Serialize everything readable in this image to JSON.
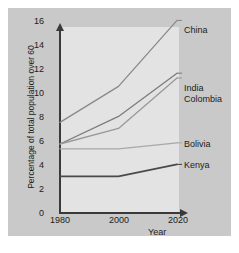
{
  "chart_data": {
    "type": "line",
    "title": "",
    "xlabel": "Year",
    "ylabel": "Percentage of total population over 60",
    "x": [
      1980,
      2000,
      2020
    ],
    "xtick_labels": [
      "1980",
      "2000",
      "2020"
    ],
    "ytick_labels": [
      "0",
      "2",
      "4",
      "6",
      "8",
      "10",
      "12",
      "14",
      "16"
    ],
    "yticks": [
      0,
      2,
      4,
      6,
      8,
      10,
      12,
      14,
      16
    ],
    "ylim": [
      0,
      16.8
    ],
    "xlim": [
      1980,
      2020
    ],
    "grid": false,
    "legend_position": "right-inline",
    "series": [
      {
        "name": "China",
        "values": [
          7.5,
          10.5,
          16.0
        ],
        "color": "#8a8a8a"
      },
      {
        "name": "India",
        "values": [
          5.7,
          8.0,
          11.6
        ],
        "color": "#7c7c7c"
      },
      {
        "name": "Colombia",
        "values": [
          5.7,
          7.0,
          11.2
        ],
        "color": "#999999"
      },
      {
        "name": "Bolivia",
        "values": [
          5.3,
          5.3,
          5.8
        ],
        "color": "#a8a8a8"
      },
      {
        "name": "Kenya",
        "values": [
          3.0,
          3.0,
          4.0
        ],
        "color": "#4a4a4a"
      }
    ]
  },
  "colors": {
    "page_background": "#ffffff",
    "figure_background": "#c9c9c9",
    "plot_background": "#e3e3e3",
    "axis": "#3a3a3a",
    "text": "#1c1c1c"
  }
}
